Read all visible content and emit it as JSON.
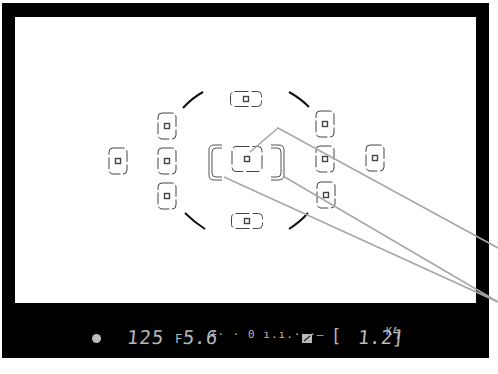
{
  "viewfinder": {
    "description": "Camera viewfinder with 15 autofocus points and information display",
    "colors": {
      "frame": "#000000",
      "viewfield": "#ffffff",
      "af_point_stroke": "#444444",
      "callout_line": "#a8a8a8",
      "lcd_text": "#b8b8b8"
    },
    "af_points": [
      {
        "id": "top",
        "orientation": "horizontal"
      },
      {
        "id": "upper-left",
        "orientation": "vertical"
      },
      {
        "id": "upper-right",
        "orientation": "vertical"
      },
      {
        "id": "far-left",
        "orientation": "vertical"
      },
      {
        "id": "mid-left",
        "orientation": "vertical"
      },
      {
        "id": "center",
        "orientation": "horizontal",
        "selected": true
      },
      {
        "id": "mid-right",
        "orientation": "vertical"
      },
      {
        "id": "far-right",
        "orientation": "vertical"
      },
      {
        "id": "lower-left",
        "orientation": "vertical"
      },
      {
        "id": "lower-right",
        "orientation": "vertical"
      },
      {
        "id": "bottom",
        "orientation": "horizontal"
      }
    ],
    "callouts": [
      {
        "target": "center-af-point"
      },
      {
        "target": "spot-area-right-bracket"
      },
      {
        "target": "spot-area-left-bracket"
      }
    ]
  },
  "info_display": {
    "meter_indicator": "●",
    "shutter_speed": "125",
    "aperture_prefix": "F",
    "aperture_value": "5.6",
    "exposure_scale": "+· · 0 ı.ı.· ·–",
    "exposure_comp_icon": "exposure-compensation-icon",
    "bracket_open": "[",
    "frames_remaining": "1.2]",
    "frames_suffix": "K",
    "flash_ready": "ϟ"
  }
}
